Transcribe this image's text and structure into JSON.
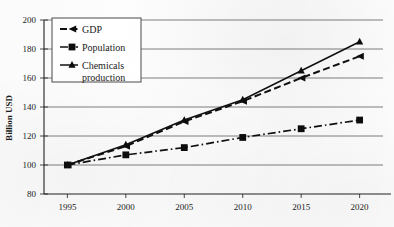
{
  "chart_data": {
    "type": "line",
    "title": "",
    "xlabel": "",
    "ylabel": "Billion USD",
    "categories": [
      "1995",
      "2000",
      "2005",
      "2010",
      "2015",
      "2020"
    ],
    "x": [
      1995,
      2000,
      2005,
      2010,
      2015,
      2020
    ],
    "xlim": [
      1993,
      2022
    ],
    "ylim": [
      80,
      200
    ],
    "ytick_step": 20,
    "yticks": [
      "80",
      "100",
      "120",
      "140",
      "160",
      "180",
      "200"
    ],
    "ytick_values": [
      80,
      100,
      120,
      140,
      160,
      180,
      200
    ],
    "xticks": [
      "1995",
      "2000",
      "2005",
      "2010",
      "2015",
      "2020"
    ],
    "grid": "horizontal",
    "legend_position": "top-left",
    "series": [
      {
        "name": "GDP",
        "marker": "arrow",
        "linestyle": "dashed",
        "color": "#101010",
        "values": [
          100,
          113,
          130,
          144,
          160,
          175
        ]
      },
      {
        "name": "Population",
        "marker": "square",
        "linestyle": "dash-dot",
        "color": "#101010",
        "values": [
          100,
          107,
          112,
          119,
          125,
          131
        ]
      },
      {
        "name": "Chemicals production",
        "marker": "triangle",
        "linestyle": "solid",
        "color": "#101010",
        "values": [
          100,
          114,
          131,
          145,
          165,
          185
        ]
      }
    ]
  },
  "axes": {
    "y_title": "Billion USD"
  },
  "legend": {
    "entries": [
      {
        "label": "GDP",
        "marker_name": "arrow-marker-icon"
      },
      {
        "label": "Population",
        "marker_name": "square-marker-icon"
      },
      {
        "label": "Chemicals",
        "label2": "production",
        "marker_name": "triangle-marker-icon"
      }
    ]
  }
}
